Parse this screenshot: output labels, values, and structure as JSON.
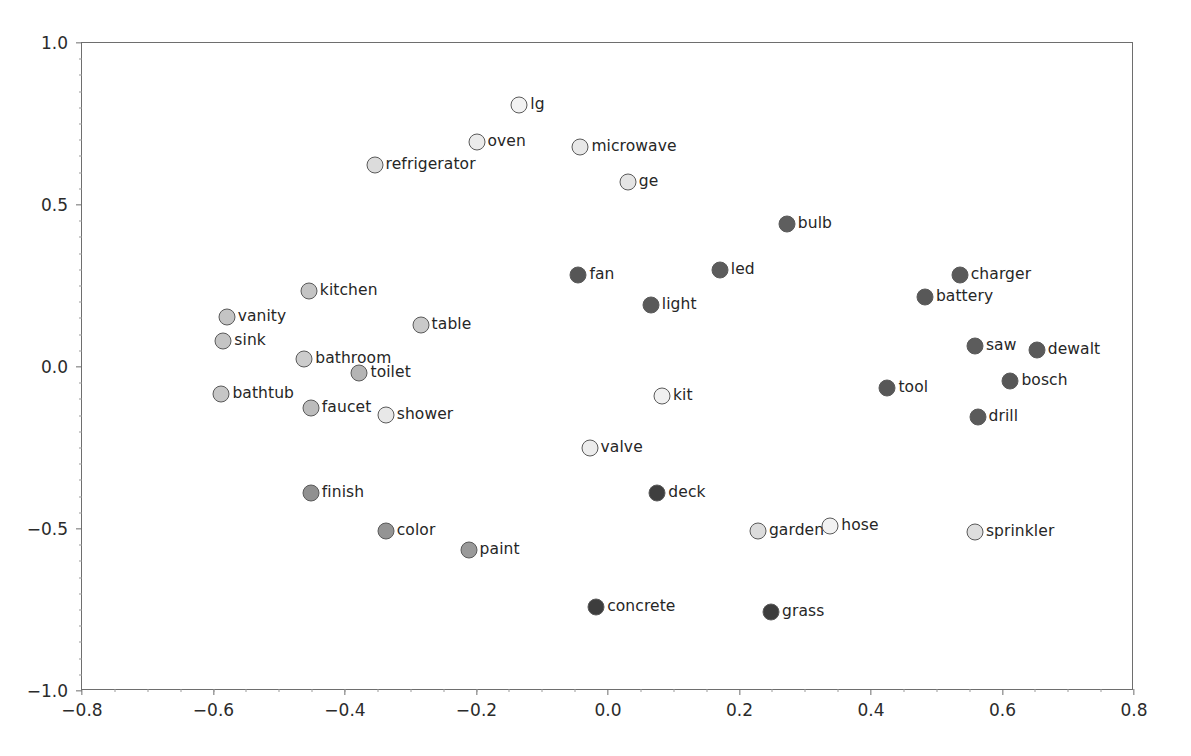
{
  "chart_data": {
    "type": "scatter",
    "title": "",
    "xlabel": "",
    "ylabel": "",
    "xlim": [
      -0.8,
      0.8
    ],
    "ylim": [
      -1.0,
      1.0
    ],
    "xticks": [
      "-0.8",
      "-0.6",
      "-0.4",
      "-0.2",
      "0.0",
      "0.2",
      "0.4",
      "0.6",
      "0.8"
    ],
    "xtick_values": [
      -0.8,
      -0.6,
      -0.4,
      -0.2,
      0.0,
      0.2,
      0.4,
      0.6,
      0.8
    ],
    "yticks": [
      "1.0",
      "0.5",
      "0.0",
      "-0.5",
      "-1.0"
    ],
    "ytick_values": [
      1.0,
      0.5,
      0.0,
      -0.5,
      -1.0
    ],
    "grid": false,
    "legend": "none",
    "marker_edge_color": "#5a5a5a",
    "colors": {
      "very_light": "#f2f2f2",
      "light": "#dcdcdc",
      "medium_light": "#c8c8c8",
      "medium": "#a8a8a8",
      "dark": "#6b6b6b",
      "very_dark": "#404040"
    },
    "points": [
      {
        "label": "lg",
        "x": -0.135,
        "y": 0.81,
        "fill": "#f2f2f2",
        "label_side": "right"
      },
      {
        "label": "oven",
        "x": -0.2,
        "y": 0.695,
        "fill": "#ebebeb",
        "label_side": "right"
      },
      {
        "label": "microwave",
        "x": -0.042,
        "y": 0.68,
        "fill": "#e8e8e8",
        "label_side": "right"
      },
      {
        "label": "refrigerator",
        "x": -0.355,
        "y": 0.625,
        "fill": "#dcdcdc",
        "label_side": "right"
      },
      {
        "label": "ge",
        "x": 0.03,
        "y": 0.57,
        "fill": "#e4e4e4",
        "label_side": "right"
      },
      {
        "label": "bulb",
        "x": 0.272,
        "y": 0.44,
        "fill": "#5e5e5e",
        "label_side": "right"
      },
      {
        "label": "fan",
        "x": -0.045,
        "y": 0.285,
        "fill": "#565656",
        "label_side": "right"
      },
      {
        "label": "led",
        "x": 0.17,
        "y": 0.3,
        "fill": "#5c5c5c",
        "label_side": "right"
      },
      {
        "label": "charger",
        "x": 0.535,
        "y": 0.285,
        "fill": "#5a5a5a",
        "label_side": "right"
      },
      {
        "label": "kitchen",
        "x": -0.455,
        "y": 0.235,
        "fill": "#c4c4c4",
        "label_side": "right"
      },
      {
        "label": "battery",
        "x": 0.482,
        "y": 0.215,
        "fill": "#585858",
        "label_side": "right"
      },
      {
        "label": "light",
        "x": 0.065,
        "y": 0.19,
        "fill": "#5a5a5a",
        "label_side": "right"
      },
      {
        "label": "vanity",
        "x": -0.58,
        "y": 0.155,
        "fill": "#c4c4c4",
        "label_side": "right"
      },
      {
        "label": "table",
        "x": -0.285,
        "y": 0.13,
        "fill": "#c9c9c9",
        "label_side": "right"
      },
      {
        "label": "sink",
        "x": -0.585,
        "y": 0.08,
        "fill": "#c4c4c4",
        "label_side": "right"
      },
      {
        "label": "saw",
        "x": 0.558,
        "y": 0.065,
        "fill": "#5c5c5c",
        "label_side": "right"
      },
      {
        "label": "dewalt",
        "x": 0.652,
        "y": 0.052,
        "fill": "#5a5a5a",
        "label_side": "right"
      },
      {
        "label": "bathroom",
        "x": -0.462,
        "y": 0.025,
        "fill": "#cccccc",
        "label_side": "right"
      },
      {
        "label": "toilet",
        "x": -0.378,
        "y": -0.02,
        "fill": "#b4b4b4",
        "label_side": "right"
      },
      {
        "label": "bosch",
        "x": 0.612,
        "y": -0.042,
        "fill": "#575757",
        "label_side": "right"
      },
      {
        "label": "tool",
        "x": 0.425,
        "y": -0.065,
        "fill": "#575757",
        "label_side": "right"
      },
      {
        "label": "bathtub",
        "x": -0.588,
        "y": -0.082,
        "fill": "#c6c6c6",
        "label_side": "right"
      },
      {
        "label": "kit",
        "x": 0.082,
        "y": -0.09,
        "fill": "#f0f0f0",
        "label_side": "right"
      },
      {
        "label": "faucet",
        "x": -0.452,
        "y": -0.125,
        "fill": "#bcbcbc",
        "label_side": "right"
      },
      {
        "label": "shower",
        "x": -0.338,
        "y": -0.148,
        "fill": "#e8e8e8",
        "label_side": "right"
      },
      {
        "label": "drill",
        "x": 0.562,
        "y": -0.155,
        "fill": "#5a5a5a",
        "label_side": "right"
      },
      {
        "label": "valve",
        "x": -0.028,
        "y": -0.25,
        "fill": "#ececec",
        "label_side": "right"
      },
      {
        "label": "finish",
        "x": -0.452,
        "y": -0.39,
        "fill": "#909090",
        "label_side": "right"
      },
      {
        "label": "deck",
        "x": 0.075,
        "y": -0.39,
        "fill": "#3f3f3f",
        "label_side": "right"
      },
      {
        "label": "color",
        "x": -0.338,
        "y": -0.505,
        "fill": "#949494",
        "label_side": "right"
      },
      {
        "label": "garden",
        "x": 0.228,
        "y": -0.505,
        "fill": "#dcdcdc",
        "label_side": "right"
      },
      {
        "label": "hose",
        "x": 0.338,
        "y": -0.49,
        "fill": "#f2f2f2",
        "label_side": "right"
      },
      {
        "label": "sprinkler",
        "x": 0.558,
        "y": -0.51,
        "fill": "#dedede",
        "label_side": "right"
      },
      {
        "label": "paint",
        "x": -0.212,
        "y": -0.565,
        "fill": "#9a9a9a",
        "label_side": "right"
      },
      {
        "label": "concrete",
        "x": -0.018,
        "y": -0.74,
        "fill": "#3d3d3d",
        "label_side": "right"
      },
      {
        "label": "grass",
        "x": 0.248,
        "y": -0.755,
        "fill": "#3d3d3d",
        "label_side": "right"
      }
    ]
  }
}
